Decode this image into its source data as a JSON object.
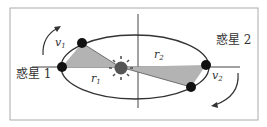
{
  "diagram": {
    "planet1_label": "惑星 1",
    "planet2_label": "惑星 2",
    "v1_label": "v",
    "v1_sub": "1",
    "v2_label": "v",
    "v2_sub": "2",
    "r1_label": "r",
    "r1_sub": "1",
    "r2_label": "r",
    "r2_sub": "2",
    "colors": {
      "frame": "#aaaaaa",
      "line": "#333333",
      "shade": "#b3b3b3",
      "planet": "#111111",
      "sun": "#555555"
    }
  }
}
